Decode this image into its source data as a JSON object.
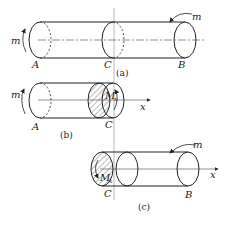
{
  "figure": {
    "panels": [
      {
        "id": "a",
        "caption": "(a)",
        "labels": {
          "left_end": "A",
          "section": "C",
          "right_end": "B",
          "left_torque": "m",
          "right_torque": "m"
        }
      },
      {
        "id": "b",
        "caption": "(b)",
        "labels": {
          "left_end": "A",
          "section": "C",
          "left_torque": "m",
          "internal_torque": "M",
          "internal_torque_sub": "x",
          "axis": "x"
        }
      },
      {
        "id": "c",
        "caption": "(c)",
        "labels": {
          "section": "C",
          "right_end": "B",
          "right_torque": "m",
          "internal_torque": "M",
          "internal_torque_sub": "x",
          "axis": "x"
        }
      }
    ],
    "colors": {
      "line": "#222222",
      "section_line": "#999999",
      "hatch": "#555555"
    }
  }
}
